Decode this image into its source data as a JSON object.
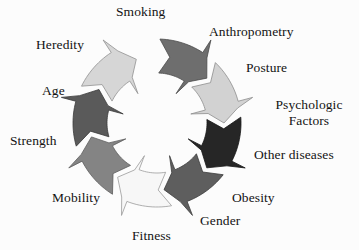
{
  "figure": {
    "type": "cycle-diagram",
    "shape": "ring-of-curved-arrows",
    "direction": "clockwise",
    "arrow_count": 8,
    "background_color": "#fcfcfc",
    "text_color": "#131313"
  },
  "labels": [
    {
      "key": "smoking",
      "text": "Smoking",
      "x": 116,
      "y": 4,
      "lines": 1
    },
    {
      "key": "anthropometry",
      "text": "Anthropometry",
      "x": 209,
      "y": 24,
      "lines": 1
    },
    {
      "key": "posture",
      "text": "Posture",
      "x": 246,
      "y": 60,
      "lines": 1
    },
    {
      "key": "psychologic",
      "text": "Psychologic\nFactors",
      "x": 259,
      "y": 97,
      "lines": 2
    },
    {
      "key": "other_diseases",
      "text": "Other diseases",
      "x": 254,
      "y": 147,
      "lines": 1
    },
    {
      "key": "obesity",
      "text": "Obesity",
      "x": 232,
      "y": 190,
      "lines": 1
    },
    {
      "key": "gender",
      "text": "Gender",
      "x": 200,
      "y": 213,
      "lines": 1
    },
    {
      "key": "fitness",
      "text": "Fitness",
      "x": 132,
      "y": 228,
      "lines": 1
    },
    {
      "key": "mobility",
      "text": "Mobility",
      "x": 52,
      "y": 190,
      "lines": 1
    },
    {
      "key": "strength",
      "text": "Strength",
      "x": 10,
      "y": 133,
      "lines": 1
    },
    {
      "key": "age",
      "text": "Age",
      "x": 42,
      "y": 83,
      "lines": 1
    },
    {
      "key": "heredity",
      "text": "Heredity",
      "x": 36,
      "y": 37,
      "lines": 1
    }
  ],
  "arrows": [
    {
      "key": "arrow-top",
      "start_deg": -88,
      "end_deg": -44,
      "fill": "#6e6e6e",
      "stroke": "#4a4a4a"
    },
    {
      "key": "arrow-top-right",
      "start_deg": -46,
      "end_deg": -2,
      "fill": "#d2d2d2",
      "stroke": "#8d8d8d"
    },
    {
      "key": "arrow-right",
      "start_deg": -4,
      "end_deg": 40,
      "fill": "#262626",
      "stroke": "#161616"
    },
    {
      "key": "arrow-bottom-right",
      "start_deg": 38,
      "end_deg": 82,
      "fill": "#5e5e5e",
      "stroke": "#3c3c3c"
    },
    {
      "key": "arrow-bottom",
      "start_deg": 80,
      "end_deg": 124,
      "fill": "#f7f7f7",
      "stroke": "#9a9a9a"
    },
    {
      "key": "arrow-bottom-left",
      "start_deg": 122,
      "end_deg": 166,
      "fill": "#848484",
      "stroke": "#5c5c5c"
    },
    {
      "key": "arrow-left",
      "start_deg": 164,
      "end_deg": 208,
      "fill": "#5a5a5a",
      "stroke": "#3a3a3a"
    },
    {
      "key": "arrow-top-left",
      "start_deg": 206,
      "end_deg": 250,
      "fill": "#d6d6d6",
      "stroke": "#909090"
    }
  ],
  "geometry": {
    "cx": 157,
    "cy": 123,
    "r_outer": 84,
    "r_inner": 50,
    "head_spread": 15,
    "head_len_deg": 13,
    "tail_notch": 9
  }
}
